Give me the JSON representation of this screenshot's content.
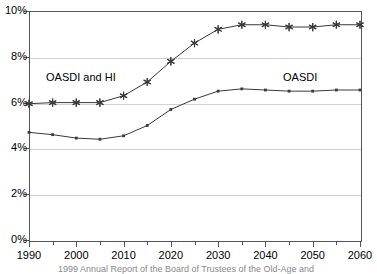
{
  "chart_data": {
    "type": "line",
    "title": "",
    "subtitle": "",
    "xlabel": "",
    "ylabel": "",
    "x": [
      1990,
      1995,
      2000,
      2005,
      2010,
      2015,
      2020,
      2025,
      2030,
      2035,
      2040,
      2045,
      2050,
      2055,
      2060
    ],
    "xlim": [
      1990,
      2060
    ],
    "ylim": [
      0,
      10
    ],
    "yunit": "%",
    "grid": true,
    "legend_position": "inline-annotations",
    "xtick_labels": [
      "1990",
      "2000",
      "2010",
      "2020",
      "2030",
      "2040",
      "2050",
      "2060"
    ],
    "xtick_values": [
      1990,
      2000,
      2010,
      2020,
      2030,
      2040,
      2050,
      2060
    ],
    "xminor_tick_values": [
      1995,
      2005,
      2015,
      2025,
      2035,
      2045,
      2055
    ],
    "ytick_labels": [
      "0%",
      "2%",
      "4%",
      "6%",
      "8%",
      "10%"
    ],
    "ytick_values": [
      0,
      2,
      4,
      6,
      8,
      10
    ],
    "series": [
      {
        "name": "OASDI and HI",
        "marker": "star",
        "color": "#3a3a3a",
        "values": [
          5.95,
          6.0,
          6.0,
          6.0,
          6.3,
          6.9,
          7.8,
          8.6,
          9.2,
          9.4,
          9.4,
          9.3,
          9.3,
          9.4,
          9.4
        ]
      },
      {
        "name": "OASDI",
        "marker": "square",
        "color": "#3a3a3a",
        "values": [
          4.7,
          4.6,
          4.45,
          4.4,
          4.55,
          5.0,
          5.7,
          6.15,
          6.5,
          6.6,
          6.55,
          6.5,
          6.5,
          6.55,
          6.55
        ]
      }
    ],
    "annotations": [
      {
        "text": "OASDI and HI",
        "x": 1996,
        "y": 7.15
      },
      {
        "text": "OASDI",
        "x": 2046,
        "y": 7.15
      }
    ]
  },
  "labels": {
    "series_oasdi_hi": "OASDI and HI",
    "series_oasdi": "OASDI"
  },
  "caption": {
    "text": "1999 Annual Report of the Board of Trustees of the Old-Age and"
  },
  "colors": {
    "axis": "#555555",
    "grid": "#d2d2d2",
    "line": "#3a3a3a",
    "text": "#000000",
    "background": "#ffffff"
  }
}
